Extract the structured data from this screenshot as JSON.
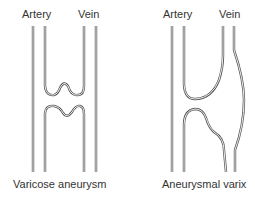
{
  "diagrams": [
    {
      "name": "varicose-aneurysm",
      "labels": {
        "left": "Artery",
        "right": "Vein"
      },
      "caption": "Varicose aneurysm"
    },
    {
      "name": "aneurysmal-varix",
      "labels": {
        "left": "Artery",
        "right": "Vein"
      },
      "caption": "Aneurysmal varix"
    }
  ],
  "colors": {
    "line": "#555555",
    "text": "#333333",
    "background": "#ffffff"
  }
}
